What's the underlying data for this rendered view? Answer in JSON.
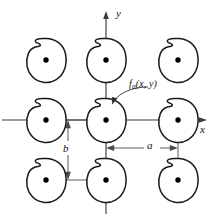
{
  "figure": {
    "type": "diagram",
    "background_color": "#ffffff",
    "line_color": "#1a1a1a",
    "axis_color": "#3a3a3a"
  },
  "axes": {
    "x_label": "x",
    "y_label": "y",
    "origin_px": {
      "x": 106,
      "y": 120
    },
    "x_axis": {
      "x1": 2,
      "y1": 120,
      "x2": 206,
      "y2": 120
    },
    "y_axis": {
      "x1": 106,
      "y1": 212,
      "x2": 106,
      "y2": 12
    }
  },
  "function_label": {
    "name": "f",
    "subscript": "a",
    "arguments": "(x, y)",
    "full_text": "fa(x, y)",
    "leader_from": {
      "x": 129,
      "y": 88
    },
    "leader_to": {
      "x": 113,
      "y": 103
    }
  },
  "dimensions": [
    {
      "name": "a",
      "label": "a",
      "orientation": "horizontal",
      "description": "horizontal spacing between adjacent aperture centers",
      "from": {
        "x": 106,
        "y": 148
      },
      "to": {
        "x": 178,
        "y": 148
      }
    },
    {
      "name": "b",
      "label": "b",
      "orientation": "vertical",
      "description": "vertical spacing between adjacent aperture rows",
      "from": {
        "x": 68,
        "y": 120
      },
      "to": {
        "x": 68,
        "y": 180
      }
    }
  ],
  "apertures": [
    {
      "id": "top-left",
      "row": "top",
      "col": "left",
      "cx": 46,
      "cy": 60,
      "grid": {
        "i": -1,
        "j": 1
      }
    },
    {
      "id": "top-center",
      "row": "top",
      "col": "center",
      "cx": 106,
      "cy": 60,
      "grid": {
        "i": 0,
        "j": 1
      }
    },
    {
      "id": "top-right",
      "row": "top",
      "col": "right",
      "cx": 178,
      "cy": 60,
      "grid": {
        "i": 1,
        "j": 1
      }
    },
    {
      "id": "middle-left",
      "row": "middle",
      "col": "left",
      "cx": 46,
      "cy": 120,
      "grid": {
        "i": -1,
        "j": 0
      }
    },
    {
      "id": "middle-center",
      "row": "middle",
      "col": "center",
      "cx": 106,
      "cy": 120,
      "grid": {
        "i": 0,
        "j": 0
      }
    },
    {
      "id": "middle-right",
      "row": "middle",
      "col": "right",
      "cx": 178,
      "cy": 120,
      "grid": {
        "i": 1,
        "j": 0
      }
    },
    {
      "id": "bottom-left",
      "row": "bottom",
      "col": "left",
      "cx": 46,
      "cy": 180,
      "grid": {
        "i": -1,
        "j": -1
      }
    },
    {
      "id": "bottom-center",
      "row": "bottom",
      "col": "center",
      "cx": 106,
      "cy": 180,
      "grid": {
        "i": 0,
        "j": -1
      }
    },
    {
      "id": "bottom-right",
      "row": "bottom",
      "col": "right",
      "cx": 178,
      "cy": 180,
      "grid": {
        "i": 1,
        "j": -1
      }
    }
  ],
  "colors": {
    "background": "#ffffff",
    "blob_stroke": "#1a1a1a",
    "dot_fill": "#000000",
    "axis": "#3a3a3a",
    "dimension": "#4a4a4a",
    "text": "#111111"
  }
}
